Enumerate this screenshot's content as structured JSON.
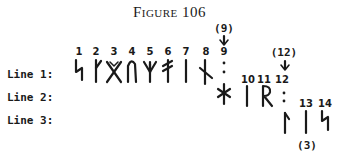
{
  "figure": {
    "title": "Figure 106"
  },
  "lines": [
    {
      "label": "Line 1:"
    },
    {
      "label": "Line 2:"
    },
    {
      "label": "Line 3:"
    }
  ],
  "rune_numbers": [
    "1",
    "2",
    "3",
    "4",
    "5",
    "6",
    "7",
    "8",
    "9",
    "10",
    "11",
    "12",
    "13",
    "14"
  ],
  "annotations": {
    "nine_marker": "(9)",
    "twelve_marker": "(12)",
    "three_marker": "(3)"
  },
  "runes": [
    {
      "n": "1",
      "line": 1,
      "shape": "s-rune"
    },
    {
      "n": "2",
      "line": 1,
      "shape": "kaun-rune"
    },
    {
      "n": "3",
      "line": 1,
      "shape": "gebo-rune"
    },
    {
      "n": "4",
      "line": 1,
      "shape": "ur-rune"
    },
    {
      "n": "5",
      "line": 1,
      "shape": "algiz-rune"
    },
    {
      "n": "6",
      "line": 1,
      "shape": "ansuz-variant-rune"
    },
    {
      "n": "7",
      "line": 1,
      "shape": "isa-rune"
    },
    {
      "n": "8",
      "line": 1,
      "shape": "nauthiz-rune"
    },
    {
      "n": "9",
      "line": 1,
      "shape": "divider-colon"
    },
    {
      "n": "9b",
      "line": 2,
      "shape": "hagall-star-rune"
    },
    {
      "n": "10",
      "line": 2,
      "shape": "isa-rune"
    },
    {
      "n": "11",
      "line": 2,
      "shape": "reid-rune"
    },
    {
      "n": "12",
      "line": 2,
      "shape": "divider-colon"
    },
    {
      "n": "12b",
      "line": 3,
      "shape": "laguz-rune"
    },
    {
      "n": "13",
      "line": 3,
      "shape": "isa-rune"
    },
    {
      "n": "14",
      "line": 3,
      "shape": "s-rune"
    }
  ]
}
